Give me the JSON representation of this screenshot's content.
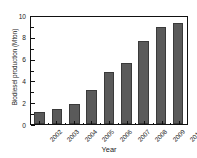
{
  "chart_data": {
    "type": "bar",
    "title": "",
    "subtitle": "",
    "xlabel": "Year",
    "ylabel": "Biodiesel production (Mton)",
    "categories": [
      "2002",
      "2003",
      "2004",
      "2005",
      "2006",
      "2007",
      "2008",
      "2009",
      "2010"
    ],
    "values": [
      1.1,
      1.4,
      1.9,
      3.2,
      4.9,
      5.7,
      7.8,
      9.1,
      9.4
    ],
    "ylim": [
      0,
      10
    ],
    "ytick_labels": [
      "0",
      "2",
      "4",
      "6",
      "8",
      "10"
    ],
    "ytick_values": [
      0,
      2,
      4,
      6,
      8,
      10
    ],
    "yminor_values": [
      1,
      3,
      5,
      7,
      9
    ],
    "grid": false,
    "legend": null,
    "legend_position": "none",
    "annotations": [],
    "bar_color": "#5a5a5a",
    "axis_color": "#111111",
    "background_color": "#ffffff",
    "xtick_rotation": -45
  }
}
